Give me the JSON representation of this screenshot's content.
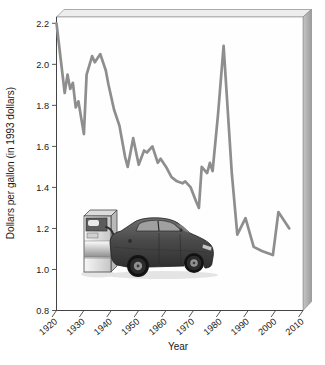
{
  "figure": {
    "description_labels": {
      "y_axis_title": "Dollars per gallon (in 1993 dollars)",
      "x_axis_title": "Year"
    }
  },
  "chart_data": {
    "type": "line",
    "title": "",
    "xlabel": "Year",
    "ylabel": "Dollars per gallon (in 1993 dollars)",
    "xlim": [
      1920,
      2010
    ],
    "ylim": [
      0.8,
      2.2
    ],
    "grid": false,
    "legend": "none",
    "x_ticks": [
      1920,
      1930,
      1940,
      1950,
      1960,
      1970,
      1980,
      1990,
      2000,
      2010
    ],
    "x_tick_labels": [
      "1920",
      "1930",
      "1940",
      "1950",
      "1960",
      "1970",
      "1980",
      "1990",
      "2000",
      "2010"
    ],
    "y_ticks": [
      0.8,
      1.0,
      1.2,
      1.4,
      1.6,
      1.8,
      2.0,
      2.2
    ],
    "y_tick_labels": [
      "0.8",
      "1.0",
      "1.2",
      "1.4",
      "1.6",
      "1.8",
      "2.0",
      "2.2"
    ],
    "series": [
      {
        "name": "gasoline-price-1993-dollars",
        "points": [
          [
            1920,
            2.2
          ],
          [
            1923,
            1.86
          ],
          [
            1924,
            1.95
          ],
          [
            1925,
            1.88
          ],
          [
            1926,
            1.91
          ],
          [
            1927,
            1.79
          ],
          [
            1928,
            1.82
          ],
          [
            1930,
            1.66
          ],
          [
            1931,
            1.95
          ],
          [
            1933,
            2.04
          ],
          [
            1934,
            2.01
          ],
          [
            1936,
            2.05
          ],
          [
            1938,
            1.97
          ],
          [
            1939,
            1.9
          ],
          [
            1941,
            1.78
          ],
          [
            1943,
            1.7
          ],
          [
            1945,
            1.55
          ],
          [
            1946,
            1.5
          ],
          [
            1948,
            1.64
          ],
          [
            1950,
            1.51
          ],
          [
            1952,
            1.58
          ],
          [
            1953,
            1.57
          ],
          [
            1955,
            1.6
          ],
          [
            1957,
            1.52
          ],
          [
            1958,
            1.54
          ],
          [
            1960,
            1.5
          ],
          [
            1962,
            1.45
          ],
          [
            1964,
            1.43
          ],
          [
            1966,
            1.42
          ],
          [
            1967,
            1.43
          ],
          [
            1969,
            1.4
          ],
          [
            1971,
            1.33
          ],
          [
            1972,
            1.3
          ],
          [
            1973,
            1.5
          ],
          [
            1975,
            1.47
          ],
          [
            1976,
            1.52
          ],
          [
            1977,
            1.48
          ],
          [
            1979,
            1.76
          ],
          [
            1981,
            2.09
          ],
          [
            1984,
            1.47
          ],
          [
            1986,
            1.17
          ],
          [
            1989,
            1.25
          ],
          [
            1992,
            1.11
          ],
          [
            1995,
            1.09
          ],
          [
            1999,
            1.07
          ],
          [
            2001,
            1.28
          ],
          [
            2005,
            1.2
          ]
        ]
      }
    ],
    "colors": {
      "line": "#8e8e8e",
      "axis": "#444444",
      "text": "#1a1a1a",
      "slab_top": "#ededed",
      "slab_side": "#b0b0b0",
      "plot_face": "#fefefe",
      "car_body": "#4a4a4a",
      "pump_body": "#d9d9d9"
    },
    "annotations": [
      "car refueling at gas pump illustration inside plot area"
    ]
  }
}
